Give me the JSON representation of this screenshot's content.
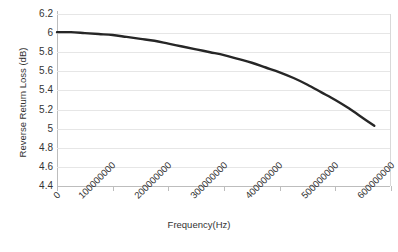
{
  "chart_data": {
    "type": "line",
    "title": "",
    "xlabel": "Frequency(Hz)",
    "ylabel": "Reverse Return Loss (dB)",
    "xlim": [
      0,
      600000000
    ],
    "ylim": [
      4.4,
      6.2
    ],
    "grid": true,
    "legend": "none",
    "x_ticks": [
      "0",
      "100000000",
      "200000000",
      "300000000",
      "400000000",
      "500000000",
      "600000000"
    ],
    "x_tick_values": [
      0,
      100000000,
      200000000,
      300000000,
      400000000,
      500000000,
      600000000
    ],
    "y_ticks": [
      "6.2",
      "6",
      "5.8",
      "5.6",
      "5.4",
      "5.2",
      "5",
      "4.8",
      "4.6",
      "4.4"
    ],
    "y_tick_values": [
      6.2,
      6.0,
      5.8,
      5.6,
      5.4,
      5.2,
      5.0,
      4.8,
      4.6,
      4.4
    ],
    "series": [
      {
        "name": "Reverse Return Loss",
        "color": "#262626",
        "x": [
          0,
          25000000,
          50000000,
          75000000,
          100000000,
          125000000,
          150000000,
          175000000,
          200000000,
          225000000,
          250000000,
          275000000,
          300000000,
          325000000,
          350000000,
          375000000,
          400000000,
          425000000,
          450000000,
          475000000,
          500000000,
          525000000,
          550000000,
          570000000
        ],
        "values": [
          6.01,
          6.01,
          6.0,
          5.99,
          5.98,
          5.96,
          5.94,
          5.92,
          5.89,
          5.86,
          5.83,
          5.8,
          5.77,
          5.73,
          5.69,
          5.64,
          5.59,
          5.53,
          5.46,
          5.38,
          5.3,
          5.21,
          5.11,
          5.03
        ]
      }
    ]
  }
}
